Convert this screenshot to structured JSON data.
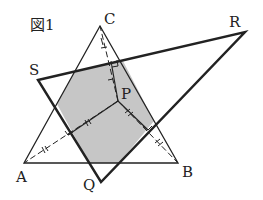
{
  "figure": {
    "title": "図1",
    "labels": {
      "A": "A",
      "B": "B",
      "C": "C",
      "P": "P",
      "Q": "Q",
      "R": "R",
      "S": "S"
    },
    "colors": {
      "stroke": "#222222",
      "shade": "#c8c8c8",
      "background": "#ffffff"
    },
    "points": {
      "A": [
        24,
        163
      ],
      "B": [
        178,
        163
      ],
      "C": [
        100,
        26
      ],
      "P": [
        118,
        101
      ],
      "Q": [
        101,
        182
      ],
      "R": [
        245,
        32
      ],
      "S": [
        38,
        80
      ]
    }
  }
}
